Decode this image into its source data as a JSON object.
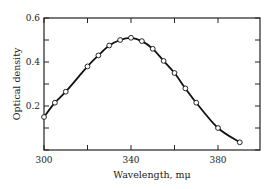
{
  "chart_data": {
    "type": "line",
    "title": "",
    "xlabel": "Wavelength, mμ",
    "ylabel": "Optical density",
    "xlim": [
      300,
      392
    ],
    "ylim": [
      0,
      0.6
    ],
    "x_ticks": [
      300,
      320,
      340,
      360,
      380
    ],
    "x_tick_labels": [
      "300",
      "",
      "340",
      "",
      "380"
    ],
    "y_ticks": [
      0,
      0.1,
      0.2,
      0.3,
      0.4,
      0.5,
      0.6
    ],
    "y_tick_labels": [
      "",
      "",
      "0.2",
      "",
      "0.4",
      "",
      "0.6"
    ],
    "grid": false,
    "legend": null,
    "series": [
      {
        "name": "Optical density",
        "markers": "open-circle",
        "line": "smooth",
        "x": [
          300,
          305,
          310,
          320,
          325,
          330,
          335,
          340,
          345,
          350,
          355,
          360,
          365,
          370,
          380,
          390
        ],
        "values": [
          0.15,
          0.215,
          0.265,
          0.38,
          0.43,
          0.475,
          0.5,
          0.51,
          0.495,
          0.46,
          0.405,
          0.35,
          0.28,
          0.215,
          0.1,
          0.035
        ]
      }
    ]
  },
  "colors": {
    "line": "#111111",
    "marker_fill": "#ffffff",
    "axis": "#222222"
  }
}
